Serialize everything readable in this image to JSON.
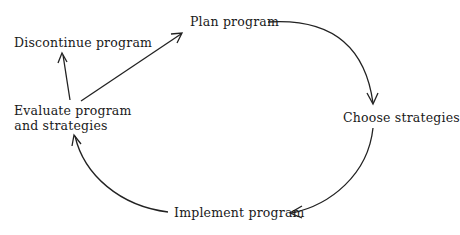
{
  "diagram": {
    "type": "cycle",
    "nodes": {
      "plan": {
        "label": "Plan program"
      },
      "choose": {
        "label": "Choose strategies"
      },
      "implement": {
        "label": "Implement program"
      },
      "evaluate": {
        "line1": "Evaluate program",
        "line2": "and strategies"
      },
      "discontinue": {
        "label": "Discontinue program"
      }
    },
    "edges": [
      {
        "from": "Plan program",
        "to": "Choose strategies"
      },
      {
        "from": "Choose strategies",
        "to": "Implement program"
      },
      {
        "from": "Implement program",
        "to": "Evaluate program and strategies"
      },
      {
        "from": "Evaluate program and strategies",
        "to": "Plan program"
      },
      {
        "from": "Evaluate program and strategies",
        "to": "Discontinue program"
      }
    ],
    "colors": {
      "text": "#1a1a1a",
      "stroke": "#222222",
      "background": "#ffffff"
    }
  }
}
